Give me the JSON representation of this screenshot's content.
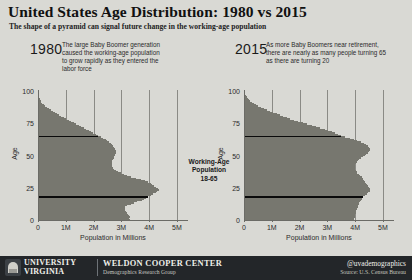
{
  "header": {
    "title": "United States Age Distribution: 1980 vs 2015",
    "subtitle": "The shape of a pyramid can signal future change in the working-age population"
  },
  "panels": {
    "left": {
      "year": "1980",
      "annotation": "The large Baby Boomer generation\ncaused the working-age population\nto grow rapidly as they entered the\nlabor force"
    },
    "right": {
      "year": "2015",
      "annotation": "As more Baby Boomers near retirement,\nthere are nearly as many people turning 65\nas there are turning 20"
    }
  },
  "center_caption": "Working-Age\nPopulation\n18-65",
  "footer": {
    "university_line1": "UNIVERSITY",
    "university_line2": "VIRGINIA",
    "center_name": "WELDON COOPER CENTER",
    "center_sub": "Demographics Research Group",
    "handle": "@uvademographics",
    "source": "Source: U.S. Census Bureau"
  },
  "colors": {
    "background": "#d9d9d4",
    "bar_fill": "#77776f",
    "axis": "#6b6b66",
    "gridline": "#8a8a85",
    "marker_line": "#0a0a0a",
    "footer_bg": "#232629",
    "footer_text": "#efefe9"
  },
  "chart_data": [
    {
      "type": "bar",
      "orientation": "horizontal",
      "title": "1980",
      "xlabel": "Population in Millions",
      "ylabel": "Age",
      "xlim": [
        0,
        5400000
      ],
      "ylim": [
        0,
        101
      ],
      "grid": true,
      "legend": false,
      "xticks": [
        0,
        1000000,
        2000000,
        3000000,
        4000000,
        5000000
      ],
      "xticklabels": [
        "0",
        "1M",
        "2M",
        "3M",
        "4M",
        "5M"
      ],
      "yticks": [
        0,
        25,
        50,
        75,
        100
      ],
      "yticklabels": [
        "0",
        "25",
        "50",
        "75",
        "100"
      ],
      "marker_lines": [
        18,
        65
      ],
      "categories": [
        0,
        1,
        2,
        3,
        4,
        5,
        6,
        7,
        8,
        9,
        10,
        11,
        12,
        13,
        14,
        15,
        16,
        17,
        18,
        19,
        20,
        21,
        22,
        23,
        24,
        25,
        26,
        27,
        28,
        29,
        30,
        31,
        32,
        33,
        34,
        35,
        36,
        37,
        38,
        39,
        40,
        41,
        42,
        43,
        44,
        45,
        46,
        47,
        48,
        49,
        50,
        51,
        52,
        53,
        54,
        55,
        56,
        57,
        58,
        59,
        60,
        61,
        62,
        63,
        64,
        65,
        66,
        67,
        68,
        69,
        70,
        71,
        72,
        73,
        74,
        75,
        76,
        77,
        78,
        79,
        80,
        81,
        82,
        83,
        84,
        85,
        86,
        87,
        88,
        89,
        90,
        91,
        92,
        93,
        94,
        95,
        96,
        97,
        98,
        99,
        100
      ],
      "values": [
        3310000,
        3280000,
        3300000,
        3260000,
        3230000,
        3190000,
        3160000,
        3130000,
        3120000,
        3090000,
        3120000,
        3220000,
        3340000,
        3460000,
        3580000,
        3730000,
        3830000,
        3900000,
        3970000,
        4060000,
        4140000,
        4230000,
        4300000,
        4350000,
        4330000,
        4250000,
        4170000,
        4110000,
        4050000,
        3970000,
        3860000,
        3720000,
        3540000,
        3360000,
        3190000,
        3080000,
        2980000,
        2880000,
        2800000,
        2740000,
        2700000,
        2680000,
        2670000,
        2660000,
        2650000,
        2660000,
        2680000,
        2700000,
        2720000,
        2740000,
        2760000,
        2780000,
        2790000,
        2790000,
        2780000,
        2760000,
        2730000,
        2700000,
        2660000,
        2610000,
        2560000,
        2500000,
        2430000,
        2350000,
        2260000,
        2170000,
        2070000,
        1980000,
        1900000,
        1820000,
        1730000,
        1640000,
        1550000,
        1460000,
        1370000,
        1280000,
        1190000,
        1100000,
        1010000,
        930000,
        840000,
        760000,
        680000,
        600000,
        530000,
        450000,
        380000,
        320000,
        260000,
        210000,
        160000,
        125000,
        95000,
        72000,
        54000,
        40000,
        29000,
        20000,
        13000,
        8000,
        4500,
        2000
      ]
    },
    {
      "type": "bar",
      "orientation": "horizontal",
      "title": "2015",
      "xlabel": "Population in Millions",
      "ylabel": "Age",
      "xlim": [
        0,
        5400000
      ],
      "ylim": [
        0,
        101
      ],
      "grid": true,
      "legend": false,
      "xticks": [
        0,
        1000000,
        2000000,
        3000000,
        4000000,
        5000000
      ],
      "xticklabels": [
        "0",
        "1M",
        "2M",
        "3M",
        "4M",
        "5M"
      ],
      "yticks": [
        0,
        25,
        50,
        75,
        100
      ],
      "yticklabels": [
        "0",
        "25",
        "50",
        "75",
        "100"
      ],
      "marker_lines": [
        18,
        65
      ],
      "categories": [
        0,
        1,
        2,
        3,
        4,
        5,
        6,
        7,
        8,
        9,
        10,
        11,
        12,
        13,
        14,
        15,
        16,
        17,
        18,
        19,
        20,
        21,
        22,
        23,
        24,
        25,
        26,
        27,
        28,
        29,
        30,
        31,
        32,
        33,
        34,
        35,
        36,
        37,
        38,
        39,
        40,
        41,
        42,
        43,
        44,
        45,
        46,
        47,
        48,
        49,
        50,
        51,
        52,
        53,
        54,
        55,
        56,
        57,
        58,
        59,
        60,
        61,
        62,
        63,
        64,
        65,
        66,
        67,
        68,
        69,
        70,
        71,
        72,
        73,
        74,
        75,
        76,
        77,
        78,
        79,
        80,
        81,
        82,
        83,
        84,
        85,
        86,
        87,
        88,
        89,
        90,
        91,
        92,
        93,
        94,
        95,
        96,
        97,
        98,
        99,
        100
      ],
      "values": [
        3950000,
        3960000,
        3980000,
        4000000,
        4010000,
        4020000,
        4030000,
        4040000,
        4060000,
        4080000,
        4100000,
        4120000,
        4140000,
        4150000,
        4170000,
        4200000,
        4230000,
        4260000,
        4300000,
        4350000,
        4420000,
        4480000,
        4520000,
        4540000,
        4530000,
        4500000,
        4460000,
        4420000,
        4390000,
        4360000,
        4330000,
        4300000,
        4270000,
        4230000,
        4180000,
        4130000,
        4080000,
        4050000,
        4030000,
        4010000,
        4000000,
        3990000,
        3990000,
        4000000,
        4020000,
        4050000,
        4090000,
        4140000,
        4200000,
        4270000,
        4340000,
        4400000,
        4450000,
        4490000,
        4520000,
        4530000,
        4510000,
        4470000,
        4400000,
        4310000,
        4200000,
        4080000,
        3950000,
        3800000,
        3650000,
        3500000,
        3380000,
        3270000,
        3160000,
        3040000,
        2900000,
        2750000,
        2590000,
        2430000,
        2270000,
        2110000,
        1950000,
        1800000,
        1660000,
        1530000,
        1410000,
        1290000,
        1170000,
        1050000,
        930000,
        820000,
        710000,
        610000,
        520000,
        440000,
        360000,
        290000,
        230000,
        180000,
        135000,
        98000,
        68000,
        45000,
        28000,
        16000,
        7000
      ]
    }
  ]
}
